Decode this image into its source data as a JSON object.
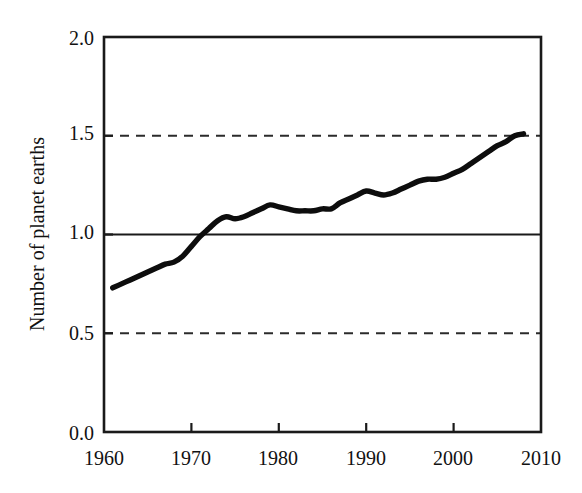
{
  "chart_data": {
    "type": "line",
    "title": "",
    "subtitle": "",
    "xlabel": "",
    "ylabel": "Number of planet earths",
    "xlim": [
      1960,
      2010
    ],
    "ylim": [
      0.0,
      2.0
    ],
    "grid": false,
    "legend": null,
    "x_ticks": [
      "1960",
      "1970",
      "1980",
      "1990",
      "2000",
      "2010"
    ],
    "x_tick_values": [
      1960,
      1970,
      1980,
      1990,
      2000,
      2010
    ],
    "y_ticks": [
      "0.0",
      "0.5",
      "1.0",
      "1.5",
      "2.0"
    ],
    "y_tick_values": [
      0.0,
      0.5,
      1.0,
      1.5,
      2.0
    ],
    "reference_lines": [
      {
        "value": 1.5,
        "style": "dashed",
        "label": ""
      },
      {
        "value": 1.0,
        "style": "solid",
        "label": ""
      },
      {
        "value": 0.5,
        "style": "dashed",
        "label": ""
      }
    ],
    "series": [
      {
        "name": "Humanity's Ecological Footprint",
        "x": [
          1961,
          1962,
          1963,
          1964,
          1965,
          1966,
          1967,
          1968,
          1969,
          1970,
          1971,
          1972,
          1973,
          1974,
          1975,
          1976,
          1977,
          1978,
          1979,
          1980,
          1981,
          1982,
          1983,
          1984,
          1985,
          1986,
          1987,
          1988,
          1989,
          1990,
          1991,
          1992,
          1993,
          1994,
          1995,
          1996,
          1997,
          1998,
          1999,
          2000,
          2001,
          2002,
          2003,
          2004,
          2005,
          2006,
          2007,
          2008
        ],
        "values": [
          0.73,
          0.75,
          0.77,
          0.79,
          0.81,
          0.83,
          0.85,
          0.86,
          0.89,
          0.94,
          0.99,
          1.03,
          1.07,
          1.09,
          1.08,
          1.09,
          1.11,
          1.13,
          1.15,
          1.14,
          1.13,
          1.12,
          1.12,
          1.12,
          1.13,
          1.13,
          1.16,
          1.18,
          1.2,
          1.22,
          1.21,
          1.2,
          1.21,
          1.23,
          1.25,
          1.27,
          1.28,
          1.28,
          1.29,
          1.31,
          1.33,
          1.36,
          1.39,
          1.42,
          1.45,
          1.47,
          1.5,
          1.51
        ]
      }
    ],
    "colors": {
      "line": "#0d0d0d",
      "axis": "#1a1a1a",
      "reference": "#2b2b2b",
      "background": "#ffffff",
      "text": "#111111"
    }
  },
  "axis": {
    "y_title": "Number of planet earths"
  },
  "y_labels": {
    "t0": "2.0",
    "t1": "1.5",
    "t2": "1.0",
    "t3": "0.5",
    "t4": "0.0"
  },
  "x_labels": {
    "t0": "1960",
    "t1": "1970",
    "t2": "1980",
    "t3": "1990",
    "t4": "2000",
    "t5": "2010"
  }
}
